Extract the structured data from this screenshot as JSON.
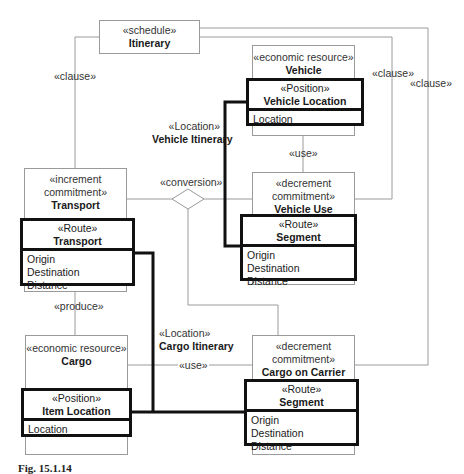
{
  "diagram": {
    "caption": "Fig. 15.1.14",
    "colors": {
      "thin_line": "#9a9a9a",
      "thick_line": "#111111",
      "text": "#1a1a1a"
    },
    "classes": {
      "itinerary": {
        "stereotype": "«schedule»",
        "name": "Itinerary"
      },
      "vehicle": {
        "stereotype": "«economic resource»",
        "name": "Vehicle"
      },
      "transport": {
        "stereotype": "«increment commitment»",
        "stereotype_l1": "«increment",
        "stereotype_l2": "commitment»",
        "name": "Transport"
      },
      "vehicle_use": {
        "stereotype_l1": "«decrement",
        "stereotype_l2": "commitment»",
        "name": "Vehicle Use"
      },
      "cargo": {
        "stereotype": "«economic resource»",
        "name": "Cargo"
      },
      "cargo_on_carrier": {
        "stereotype_l1": "«decrement",
        "stereotype_l2": "commitment»",
        "name": "Cargo on Carrier"
      }
    },
    "roles": {
      "vehicle_location": {
        "stereotype": "«Position»",
        "name": "Vehicle Location",
        "attributes": [
          "Location"
        ]
      },
      "transport_route": {
        "stereotype": "«Route»",
        "name": "Transport",
        "attributes": [
          "Origin",
          "Destination",
          "Distance"
        ]
      },
      "vehicle_segment": {
        "stereotype": "«Route»",
        "name": "Segment",
        "attributes": [
          "Origin",
          "Destination",
          "Distance"
        ]
      },
      "item_location": {
        "stereotype": "«Position»",
        "name": "Item Location",
        "attributes": [
          "Location"
        ]
      },
      "cargo_segment": {
        "stereotype": "«Route»",
        "name": "Segment",
        "attributes": [
          "Origin",
          "Destination",
          "Distance"
        ]
      }
    },
    "associations": {
      "clause_left": "«clause»",
      "clause_right_inner": "«clause»",
      "clause_right_outer": "«clause»",
      "use_vehicle": "«use»",
      "conversion": "«conversion»",
      "produce": "«produce»",
      "use_cargo": "«use»",
      "vehicle_itinerary": {
        "stereotype": "«Location»",
        "name": "Vehicle Itinerary"
      },
      "cargo_itinerary": {
        "stereotype": "«Location»",
        "name": "Cargo Itinerary"
      }
    }
  }
}
